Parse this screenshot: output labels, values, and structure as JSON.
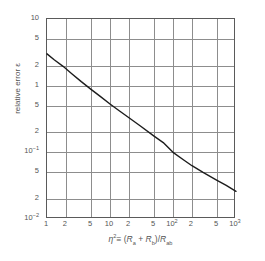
{
  "chart_data": {
    "type": "line",
    "title": "",
    "xlabel": "η² ≡ (R_a + R_b)/R_ab",
    "ylabel": "relative error ε",
    "xscale": "log",
    "yscale": "log",
    "xlim": [
      1,
      1000
    ],
    "ylim": [
      0.01,
      10
    ],
    "grid": true,
    "legend": null,
    "x_tick_labels": [
      "1",
      "2",
      "5",
      "10",
      "2",
      "5",
      "10²",
      "2",
      "5",
      "10³"
    ],
    "x_tick_values": [
      1,
      2,
      5,
      10,
      20,
      50,
      100,
      200,
      500,
      1000
    ],
    "y_tick_labels": [
      "10",
      "5",
      "2",
      "1",
      "5",
      "2",
      "10⁻¹",
      "5",
      "2",
      "10⁻²"
    ],
    "y_tick_values": [
      10,
      5,
      2,
      1,
      0.5,
      0.2,
      0.1,
      0.05,
      0.02,
      0.01
    ],
    "series": [
      {
        "name": "relative error",
        "x": [
          1,
          1.3,
          1.8,
          2.5,
          3.5,
          5,
          7,
          10,
          14,
          20,
          30,
          50,
          70,
          100,
          150,
          200,
          300,
          500,
          700,
          1000
        ],
        "y": [
          3.0,
          2.45,
          1.95,
          1.5,
          1.15,
          0.88,
          0.69,
          0.53,
          0.42,
          0.33,
          0.25,
          0.175,
          0.14,
          0.1,
          0.076,
          0.063,
          0.05,
          0.038,
          0.032,
          0.026
        ]
      }
    ]
  },
  "axes": {
    "y_title_text": "relative error ε",
    "x_title": {
      "eta": "η",
      "eta_exp": "2",
      "equiv": "≡ (",
      "r_a": "R",
      "r_a_sub": "a",
      "plus": " + ",
      "r_b": "R",
      "r_b_sub": "b",
      "close_slash": ")/",
      "r_ab": "R",
      "r_ab_sub": "ab"
    }
  },
  "x_ticks": [
    {
      "label_main": "1",
      "label_sup": "",
      "pos": 0.0
    },
    {
      "label_main": "2",
      "label_sup": "",
      "pos": 0.1003
    },
    {
      "label_main": "5",
      "label_sup": "",
      "pos": 0.233
    },
    {
      "label_main": "10",
      "label_sup": "",
      "pos": 0.3333
    },
    {
      "label_main": "2",
      "label_sup": "",
      "pos": 0.4337
    },
    {
      "label_main": "5",
      "label_sup": "",
      "pos": 0.5663
    },
    {
      "label_main": "10",
      "label_sup": "2",
      "pos": 0.6667
    },
    {
      "label_main": "2",
      "label_sup": "",
      "pos": 0.767
    },
    {
      "label_main": "5",
      "label_sup": "",
      "pos": 0.8997
    },
    {
      "label_main": "10",
      "label_sup": "3",
      "pos": 1.0
    }
  ],
  "y_ticks": [
    {
      "label_main": "10",
      "label_sup": "",
      "pos": 0.0
    },
    {
      "label_main": "5",
      "label_sup": "",
      "pos": 0.1003
    },
    {
      "label_main": "2",
      "label_sup": "",
      "pos": 0.233
    },
    {
      "label_main": "1",
      "label_sup": "",
      "pos": 0.3333
    },
    {
      "label_main": "5",
      "label_sup": "",
      "pos": 0.4337
    },
    {
      "label_main": "2",
      "label_sup": "",
      "pos": 0.5663
    },
    {
      "label_main": "10",
      "label_sup": "-1",
      "pos": 0.6667
    },
    {
      "label_main": "5",
      "label_sup": "",
      "pos": 0.767
    },
    {
      "label_main": "2",
      "label_sup": "",
      "pos": 0.8997
    },
    {
      "label_main": "10",
      "label_sup": "-2",
      "pos": 1.0
    }
  ],
  "colors": {
    "curve": "#1c1c1c",
    "grid": "#8d8d8d",
    "frame": "#5a5a5a",
    "text": "#555555",
    "background": "#ffffff"
  }
}
